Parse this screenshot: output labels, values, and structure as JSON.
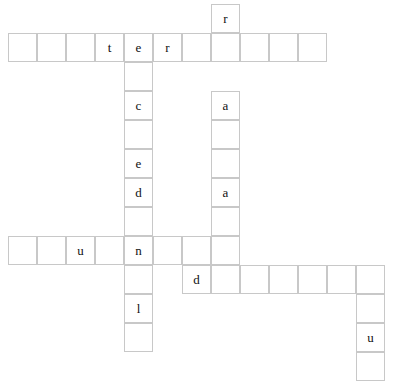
{
  "board": {
    "title": "crossword-grid",
    "cell_size": 29,
    "origin_x": 8,
    "origin_y": 4,
    "grid_line_color": "#c8c8c8",
    "cell_fill_color": "#ffffff",
    "letter_color": "#111111",
    "background_color": "#ffffff",
    "columns": 14,
    "rows": 13,
    "cells": [
      {
        "row": 0,
        "col": 7,
        "letter": "r"
      },
      {
        "row": 1,
        "col": 0,
        "letter": ""
      },
      {
        "row": 1,
        "col": 1,
        "letter": ""
      },
      {
        "row": 1,
        "col": 2,
        "letter": ""
      },
      {
        "row": 1,
        "col": 3,
        "letter": "t"
      },
      {
        "row": 1,
        "col": 4,
        "letter": "e"
      },
      {
        "row": 1,
        "col": 5,
        "letter": "r"
      },
      {
        "row": 1,
        "col": 6,
        "letter": ""
      },
      {
        "row": 1,
        "col": 7,
        "letter": ""
      },
      {
        "row": 1,
        "col": 8,
        "letter": ""
      },
      {
        "row": 1,
        "col": 9,
        "letter": ""
      },
      {
        "row": 1,
        "col": 10,
        "letter": ""
      },
      {
        "row": 2,
        "col": 4,
        "letter": ""
      },
      {
        "row": 3,
        "col": 4,
        "letter": "c"
      },
      {
        "row": 3,
        "col": 7,
        "letter": "a"
      },
      {
        "row": 4,
        "col": 4,
        "letter": ""
      },
      {
        "row": 4,
        "col": 7,
        "letter": ""
      },
      {
        "row": 5,
        "col": 4,
        "letter": "e"
      },
      {
        "row": 5,
        "col": 7,
        "letter": ""
      },
      {
        "row": 6,
        "col": 4,
        "letter": "d"
      },
      {
        "row": 6,
        "col": 7,
        "letter": "a"
      },
      {
        "row": 7,
        "col": 4,
        "letter": ""
      },
      {
        "row": 7,
        "col": 7,
        "letter": ""
      },
      {
        "row": 8,
        "col": 0,
        "letter": ""
      },
      {
        "row": 8,
        "col": 1,
        "letter": ""
      },
      {
        "row": 8,
        "col": 2,
        "letter": "u"
      },
      {
        "row": 8,
        "col": 3,
        "letter": ""
      },
      {
        "row": 8,
        "col": 4,
        "letter": "n"
      },
      {
        "row": 8,
        "col": 5,
        "letter": ""
      },
      {
        "row": 8,
        "col": 6,
        "letter": ""
      },
      {
        "row": 8,
        "col": 7,
        "letter": ""
      },
      {
        "row": 9,
        "col": 4,
        "letter": ""
      },
      {
        "row": 9,
        "col": 6,
        "letter": "d"
      },
      {
        "row": 9,
        "col": 7,
        "letter": ""
      },
      {
        "row": 9,
        "col": 8,
        "letter": ""
      },
      {
        "row": 9,
        "col": 9,
        "letter": ""
      },
      {
        "row": 9,
        "col": 10,
        "letter": ""
      },
      {
        "row": 9,
        "col": 11,
        "letter": ""
      },
      {
        "row": 9,
        "col": 12,
        "letter": ""
      },
      {
        "row": 10,
        "col": 4,
        "letter": "l"
      },
      {
        "row": 10,
        "col": 12,
        "letter": ""
      },
      {
        "row": 11,
        "col": 4,
        "letter": ""
      },
      {
        "row": 11,
        "col": 12,
        "letter": "u"
      },
      {
        "row": 12,
        "col": 12,
        "letter": ""
      }
    ],
    "visible_letters": [
      "r",
      "t",
      "e",
      "r",
      "c",
      "a",
      "e",
      "d",
      "a",
      "u",
      "n",
      "d",
      "l",
      "u"
    ]
  }
}
